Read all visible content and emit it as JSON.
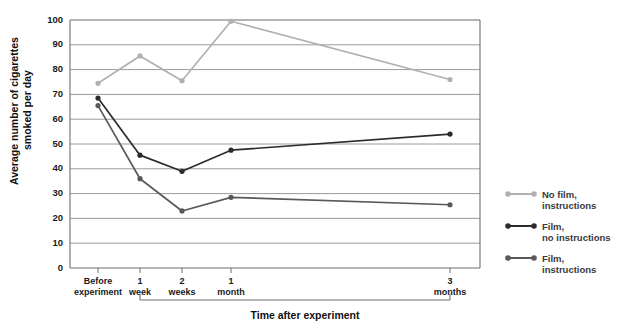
{
  "chart_data": {
    "type": "line",
    "title": "",
    "xlabel": "Time after experiment",
    "ylabel": "Average number of cigarettes smoked per day",
    "categories": [
      "Before experiment",
      "1 week",
      "2 weeks",
      "1 month",
      "3 months"
    ],
    "category_lines": [
      [
        "Before",
        "experiment"
      ],
      [
        "1",
        "week"
      ],
      [
        "2",
        "weeks"
      ],
      [
        "1",
        "month"
      ],
      [
        "3",
        "months"
      ]
    ],
    "ylim": [
      0,
      100
    ],
    "ytick_labels": [
      "0",
      "10",
      "20",
      "30",
      "40",
      "50",
      "60",
      "70",
      "80",
      "90",
      "100"
    ],
    "ytick_values": [
      0,
      10,
      20,
      30,
      40,
      50,
      60,
      70,
      80,
      90,
      100
    ],
    "grid": true,
    "legend_position": "right",
    "series": [
      {
        "name": "No film, instructions",
        "name_lines": [
          "No film,",
          "instructions"
        ],
        "color": "#b0b0b0",
        "values": [
          74.5,
          85.5,
          75.5,
          99.5,
          76.0
        ]
      },
      {
        "name": "Film, no instructions",
        "name_lines": [
          "Film,",
          "no instructions"
        ],
        "color": "#2b2b2b",
        "values": [
          68.5,
          45.5,
          39.0,
          47.5,
          54.0
        ]
      },
      {
        "name": "Film, instructions",
        "name_lines": [
          "Film,",
          "instructions"
        ],
        "color": "#595959",
        "values": [
          65.5,
          36.0,
          23.0,
          28.5,
          25.5
        ]
      }
    ]
  },
  "top_strip_text": ""
}
